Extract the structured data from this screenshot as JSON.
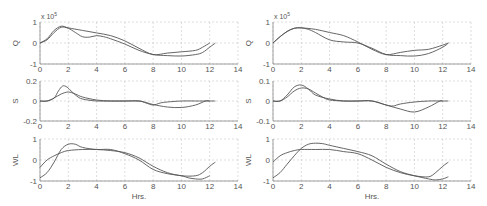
{
  "figure": {
    "width": 487,
    "height": 206,
    "grid_color": "#c8c8c8",
    "axis_color": "#888888",
    "line_color": "#555555"
  },
  "chart_data": [
    {
      "type": "line",
      "panel": "left",
      "row": 1,
      "ylabel": "Q",
      "exponent_label": "x 10",
      "exponent": "5",
      "xlim": [
        0,
        14
      ],
      "ylim": [
        -1,
        1
      ],
      "xticks": [
        "0",
        "2",
        "4",
        "6",
        "8",
        "10",
        "12",
        "14"
      ],
      "yticks": [
        "-1",
        "0",
        "1"
      ],
      "box": [
        40,
        22,
        238,
        64
      ],
      "series": [
        {
          "name": "observed",
          "x": [
            0,
            0.5,
            1,
            1.5,
            2,
            2.5,
            3,
            3.5,
            4,
            4.5,
            5,
            6,
            7,
            8,
            9,
            10,
            11,
            11.5,
            12,
            12.4
          ],
          "y": [
            0,
            0.15,
            0.5,
            0.75,
            0.7,
            0.5,
            0.3,
            0.28,
            0.35,
            0.3,
            0.2,
            -0.05,
            -0.35,
            -0.55,
            -0.6,
            -0.62,
            -0.55,
            -0.45,
            -0.2,
            0
          ]
        },
        {
          "name": "simulated",
          "x": [
            0,
            0.5,
            1,
            1.5,
            2,
            3,
            4,
            5,
            6,
            7,
            8,
            9,
            10,
            11,
            11.5,
            12
          ],
          "y": [
            0,
            0.2,
            0.6,
            0.8,
            0.72,
            0.6,
            0.48,
            0.35,
            0.1,
            -0.25,
            -0.55,
            -0.48,
            -0.42,
            -0.35,
            -0.2,
            0
          ]
        }
      ]
    },
    {
      "type": "line",
      "panel": "left",
      "row": 2,
      "ylabel": "S",
      "xlim": [
        0,
        14
      ],
      "ylim": [
        -0.2,
        0.2
      ],
      "xticks": [
        "0",
        "2",
        "4",
        "6",
        "8",
        "10",
        "12",
        "14"
      ],
      "yticks": [
        "-0.2",
        "0",
        "0.2"
      ],
      "box": [
        40,
        81,
        238,
        121
      ],
      "series": [
        {
          "name": "observed",
          "x": [
            0,
            0.5,
            1,
            1.3,
            1.6,
            1.9,
            2.2,
            2.6,
            3,
            4,
            5,
            6,
            7,
            7.5,
            8,
            8.5,
            9,
            10,
            11,
            12,
            12.4
          ],
          "y": [
            0,
            0,
            0.03,
            0.1,
            0.15,
            0.14,
            0.1,
            0.05,
            0.02,
            0,
            0,
            0,
            0,
            -0.02,
            -0.04,
            -0.02,
            -0.01,
            0,
            0,
            0,
            0
          ]
        },
        {
          "name": "simulated",
          "x": [
            0,
            0.5,
            1,
            1.5,
            2,
            2.5,
            3,
            4,
            5,
            6,
            7,
            7.5,
            8,
            9,
            10,
            11,
            11.7,
            12
          ],
          "y": [
            0,
            0,
            0.03,
            0.07,
            0.09,
            0.07,
            0.04,
            0.01,
            0,
            0,
            0,
            -0.015,
            -0.035,
            -0.06,
            -0.065,
            -0.04,
            0,
            0
          ]
        }
      ]
    },
    {
      "type": "line",
      "panel": "left",
      "row": 3,
      "ylabel": "WL",
      "xlabel": "Hrs.",
      "xlim": [
        0,
        14
      ],
      "ylim": [
        -1,
        1
      ],
      "xticks": [
        "0",
        "2",
        "4",
        "6",
        "8",
        "10",
        "12",
        "14"
      ],
      "yticks": [
        "-1",
        "0",
        "1"
      ],
      "box": [
        40,
        139,
        238,
        181
      ],
      "series": [
        {
          "name": "observed",
          "x": [
            0,
            0.5,
            1,
            1.5,
            2,
            2.5,
            3,
            4,
            5,
            6,
            7,
            8,
            9,
            10,
            10.5,
            11,
            11.5,
            12
          ],
          "y": [
            -0.85,
            -0.6,
            -0.1,
            0.5,
            0.75,
            0.75,
            0.6,
            0.5,
            0.5,
            0.3,
            0,
            -0.45,
            -0.65,
            -0.75,
            -0.85,
            -0.9,
            -0.9,
            -0.75
          ]
        },
        {
          "name": "simulated",
          "x": [
            0,
            0.5,
            1,
            1.5,
            2,
            3,
            4,
            5,
            6,
            7,
            8,
            9,
            10,
            11,
            11.5,
            12,
            12.4
          ],
          "y": [
            -0.35,
            0,
            0.2,
            0.35,
            0.45,
            0.5,
            0.5,
            0.45,
            0.35,
            0.1,
            -0.3,
            -0.6,
            -0.75,
            -0.75,
            -0.6,
            -0.3,
            -0.1
          ]
        }
      ]
    },
    {
      "type": "line",
      "panel": "right",
      "row": 1,
      "ylabel": "Q",
      "exponent_label": "x 10",
      "exponent": "5",
      "xlim": [
        0,
        14
      ],
      "ylim": [
        -1,
        1
      ],
      "xticks": [
        "0",
        "2",
        "4",
        "6",
        "8",
        "10",
        "12",
        "14"
      ],
      "yticks": [
        "-1",
        "0",
        "1"
      ],
      "box": [
        273,
        22,
        471,
        64
      ],
      "series": [
        {
          "name": "observed",
          "x": [
            0,
            0.5,
            1,
            1.5,
            2,
            2.5,
            3,
            4,
            5,
            6,
            7,
            8,
            9,
            10,
            11,
            12,
            12.4
          ],
          "y": [
            0,
            0.3,
            0.55,
            0.7,
            0.72,
            0.65,
            0.5,
            0.15,
            0.05,
            0,
            -0.25,
            -0.55,
            -0.6,
            -0.62,
            -0.5,
            -0.2,
            0
          ]
        },
        {
          "name": "simulated",
          "x": [
            0,
            0.5,
            1,
            1.5,
            2,
            3,
            4,
            5,
            6,
            7,
            8,
            9,
            10,
            11,
            12,
            12.4
          ],
          "y": [
            0,
            0.3,
            0.55,
            0.7,
            0.72,
            0.65,
            0.5,
            0.35,
            0.05,
            -0.3,
            -0.55,
            -0.45,
            -0.35,
            -0.3,
            -0.1,
            0
          ]
        }
      ]
    },
    {
      "type": "line",
      "panel": "right",
      "row": 2,
      "ylabel": "S",
      "xlim": [
        0,
        14
      ],
      "ylim": [
        -0.1,
        0.1
      ],
      "xticks": [
        "0",
        "2",
        "4",
        "6",
        "8",
        "10",
        "12",
        "14"
      ],
      "yticks": [
        "-0.1",
        "0",
        "0.1"
      ],
      "box": [
        273,
        81,
        471,
        121
      ],
      "series": [
        {
          "name": "observed",
          "x": [
            0,
            0.5,
            1,
            1.5,
            2,
            2.5,
            3,
            4,
            5,
            6,
            7,
            8,
            8.5,
            9,
            10,
            11,
            11.8,
            12,
            12.4
          ],
          "y": [
            0,
            0,
            0.03,
            0.07,
            0.08,
            0.06,
            0.03,
            0.01,
            0,
            0,
            0,
            -0.02,
            -0.025,
            -0.015,
            -0.005,
            0,
            0,
            0,
            0
          ]
        },
        {
          "name": "simulated",
          "x": [
            0,
            0.5,
            1,
            1.5,
            2,
            2.5,
            3,
            3.5,
            4,
            5,
            6,
            7,
            8,
            9,
            10,
            11,
            11.8,
            12
          ],
          "y": [
            0,
            0,
            0.02,
            0.05,
            0.065,
            0.06,
            0.04,
            0.02,
            0.005,
            0,
            0,
            0,
            -0.02,
            -0.04,
            -0.055,
            -0.03,
            0,
            0
          ]
        }
      ]
    },
    {
      "type": "line",
      "panel": "right",
      "row": 3,
      "ylabel": "WL",
      "xlabel": "Hrs.",
      "xlim": [
        0,
        14
      ],
      "ylim": [
        -1,
        1
      ],
      "xticks": [
        "0",
        "2",
        "4",
        "6",
        "8",
        "10",
        "12",
        "14"
      ],
      "yticks": [
        "-1",
        "0",
        "1"
      ],
      "box": [
        273,
        139,
        471,
        181
      ],
      "series": [
        {
          "name": "observed",
          "x": [
            0,
            0.5,
            1,
            1.5,
            2,
            2.5,
            3,
            3.5,
            4,
            5,
            6,
            7,
            8,
            9,
            10,
            11,
            11.5,
            12,
            12.4
          ],
          "y": [
            -0.85,
            -0.6,
            -0.2,
            0.2,
            0.55,
            0.75,
            0.8,
            0.78,
            0.7,
            0.55,
            0.4,
            0.2,
            -0.2,
            -0.55,
            -0.75,
            -0.9,
            -0.95,
            -0.9,
            -0.8
          ]
        },
        {
          "name": "simulated",
          "x": [
            0,
            0.5,
            1,
            1.5,
            2,
            3,
            4,
            5,
            6,
            7,
            8,
            9,
            10,
            11,
            11.5,
            12,
            12.4
          ],
          "y": [
            -0.1,
            0.2,
            0.35,
            0.45,
            0.5,
            0.5,
            0.5,
            0.4,
            0.3,
            0,
            -0.35,
            -0.6,
            -0.75,
            -0.8,
            -0.6,
            -0.3,
            -0.1
          ]
        }
      ]
    }
  ]
}
